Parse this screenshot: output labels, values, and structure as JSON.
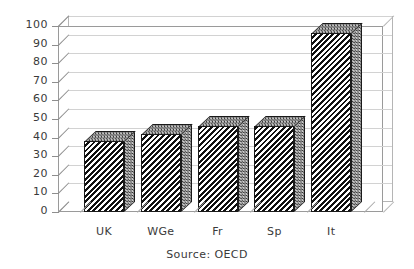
{
  "chart_data": {
    "type": "bar",
    "title": "",
    "subtitle": "",
    "xlabel": "",
    "ylabel": "",
    "categories": [
      "UK",
      "WGe",
      "Fr",
      "Sp",
      "It"
    ],
    "values": [
      38,
      42,
      46,
      46,
      96
    ],
    "ylim": [
      0,
      100
    ],
    "ytick_labels": [
      "0",
      "10",
      "20",
      "30",
      "40",
      "50",
      "60",
      "70",
      "80",
      "90",
      "100"
    ],
    "ytick_values": [
      0,
      10,
      20,
      30,
      40,
      50,
      60,
      70,
      80,
      90,
      100
    ],
    "grid": true,
    "legend": false,
    "legend_position": "none",
    "style": "3d-bar",
    "annotations": [
      "Source: OECD"
    ],
    "series": [
      {
        "name": "",
        "values": [
          38,
          42,
          46,
          46,
          96
        ]
      }
    ]
  },
  "caption": {
    "source_text": "Source: OECD"
  },
  "colors": {
    "bar_front": "#101010",
    "bar_side": "#cfcfcf",
    "bar_top": "#c6c6c6",
    "grid": "#d2d2d2",
    "axis": "#9a9a9a",
    "text": "#3a3a3a",
    "background": "#ffffff"
  }
}
